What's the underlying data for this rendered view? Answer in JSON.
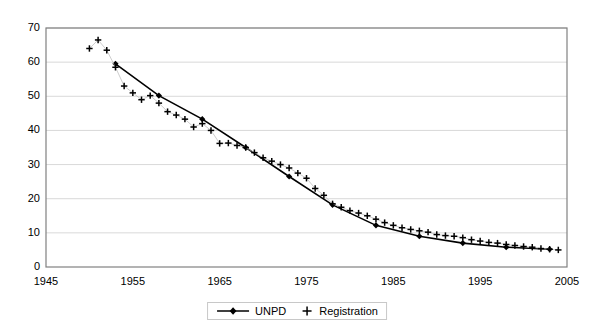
{
  "chart_data": {
    "type": "line",
    "title": "",
    "xlabel": "",
    "ylabel": "",
    "xlim": [
      1945,
      2005
    ],
    "ylim": [
      0,
      70
    ],
    "x_ticks": [
      1945,
      1955,
      1965,
      1975,
      1985,
      1995,
      2005
    ],
    "y_ticks": [
      0,
      10,
      20,
      30,
      40,
      50,
      60,
      70
    ],
    "grid": "horizontal",
    "legend_position": "bottom-center",
    "series": [
      {
        "name": "UNPD",
        "marker": "diamond",
        "line": "solid",
        "color": "#000000",
        "x": [
          1953,
          1958,
          1963,
          1968,
          1973,
          1978,
          1983,
          1988,
          1993,
          1998,
          2003
        ],
        "values": [
          59.5,
          50.2,
          43.3,
          35.0,
          26.5,
          18.2,
          12.2,
          9.0,
          7.0,
          5.8,
          5.2
        ]
      },
      {
        "name": "Registration",
        "marker": "plus",
        "line": "none",
        "color": "#000000",
        "x": [
          1950,
          1951,
          1952,
          1953,
          1954,
          1955,
          1956,
          1957,
          1958,
          1959,
          1960,
          1961,
          1962,
          1963,
          1964,
          1965,
          1966,
          1967,
          1968,
          1969,
          1970,
          1971,
          1972,
          1973,
          1974,
          1975,
          1976,
          1977,
          1978,
          1979,
          1980,
          1981,
          1982,
          1983,
          1984,
          1985,
          1986,
          1987,
          1988,
          1989,
          1990,
          1991,
          1992,
          1993,
          1994,
          1995,
          1996,
          1997,
          1998,
          1999,
          2000,
          2001,
          2002,
          2003,
          2004
        ],
        "values": [
          64.0,
          66.5,
          63.5,
          58.5,
          53.0,
          51.0,
          49.0,
          50.2,
          48.0,
          45.5,
          44.5,
          43.3,
          41.0,
          42.0,
          40.0,
          36.2,
          36.3,
          35.6,
          35.0,
          33.5,
          32.0,
          31.0,
          30.0,
          29.0,
          27.5,
          26.0,
          23.0,
          21.0,
          18.5,
          17.5,
          16.5,
          15.8,
          15.0,
          14.0,
          13.0,
          12.2,
          11.5,
          11.0,
          10.6,
          10.2,
          9.5,
          9.2,
          9.0,
          8.6,
          8.0,
          7.6,
          7.2,
          7.0,
          6.6,
          6.3,
          6.0,
          5.8,
          5.4,
          5.2,
          5.0
        ]
      }
    ],
    "legend": [
      {
        "label": "UNPD",
        "marker": "line-diamond-marker"
      },
      {
        "label": "Registration",
        "marker": "plus-marker"
      }
    ]
  },
  "axes": {
    "y_tick_labels": [
      "70",
      "60",
      "50",
      "40",
      "30",
      "20",
      "10",
      "0"
    ],
    "x_tick_labels": [
      "1945",
      "1955",
      "1965",
      "1975",
      "1985",
      "1995",
      "2005"
    ]
  },
  "colors": {
    "series": "#000000",
    "grid": "#d9d9d9",
    "axis": "#808080",
    "legend_border": "#c8c8c8",
    "background": "#ffffff"
  }
}
